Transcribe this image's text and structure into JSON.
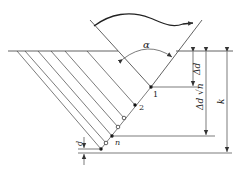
{
  "diagram": {
    "type": "engineering-geometry",
    "labels": {
      "angle": "α",
      "delta_d": "Δd",
      "delta_d_sqrt_n": "Δd √n",
      "k": "k",
      "d": "d",
      "point_1": "1",
      "point_2": "2",
      "point_n": "n"
    },
    "colors": {
      "line": "#3a3a3a",
      "background": "#ffffff"
    }
  }
}
